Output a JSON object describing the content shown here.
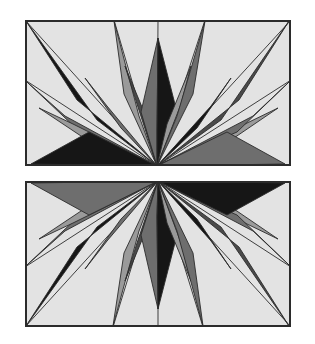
{
  "figure": {
    "background_color": "#ffffff",
    "panel_count": 2
  },
  "palette": {
    "background": "#e3e3e3",
    "border": "#2b2b2b",
    "light_gray": "#9a9a9a",
    "mid_gray": "#6e6e6e",
    "dark_gray": "#4a4a4a",
    "near_black": "#161616",
    "hairline": "#2b2b2b"
  },
  "geometry": {
    "panel_width": 266,
    "panel_height": 146,
    "panel_left": 25,
    "panel_top_y": 20,
    "panel_bottom_y": 181,
    "border_width": 2,
    "hairline_width": 0.9
  },
  "panels": [
    {
      "name": "top-panel",
      "label": "Top panel",
      "center": {
        "x": 132,
        "y": 146
      },
      "orientation": "rays-up",
      "description": "Star burst with apex at bottom edge, rays fanning upward and sideways",
      "hairlines": [
        {
          "x": 0,
          "y": 0
        },
        {
          "x": 89,
          "y": 0
        },
        {
          "x": 133,
          "y": 0
        },
        {
          "x": 180,
          "y": 0
        },
        {
          "x": 266,
          "y": 0
        },
        {
          "x": 266,
          "y": 60
        },
        {
          "x": 0,
          "y": 60
        }
      ],
      "rays": [
        {
          "id": "t-r01",
          "tip": {
            "x": 2,
            "y": 62
          },
          "l": {
            "x": 40,
            "y": 96
          },
          "r": {
            "x": 55,
            "y": 112
          },
          "shade": "mid_gray",
          "side": "left"
        },
        {
          "id": "t-r02",
          "tip": {
            "x": 14,
            "y": 88
          },
          "l": {
            "x": 48,
            "y": 104
          },
          "r": {
            "x": 62,
            "y": 120
          },
          "shade": "light_gray",
          "side": "left"
        },
        {
          "id": "t-r03",
          "tip": {
            "x": 1,
            "y": 1
          },
          "l": {
            "x": 52,
            "y": 80
          },
          "r": {
            "x": 72,
            "y": 100
          },
          "shade": "near_black",
          "side": "left"
        },
        {
          "id": "t-r04",
          "tip": {
            "x": 60,
            "y": 58
          },
          "l": {
            "x": 82,
            "y": 86
          },
          "r": {
            "x": 96,
            "y": 108
          },
          "shade": "mid_gray",
          "side": "left"
        },
        {
          "id": "t-r05",
          "tip": {
            "x": 89,
            "y": 1
          },
          "l": {
            "x": 99,
            "y": 74
          },
          "r": {
            "x": 114,
            "y": 96
          },
          "shade": "light_gray",
          "side": "left"
        },
        {
          "id": "t-r06",
          "tip": {
            "x": 100,
            "y": 46
          },
          "l": {
            "x": 112,
            "y": 84
          },
          "r": {
            "x": 124,
            "y": 104
          },
          "shade": "dark_gray",
          "side": "left"
        },
        {
          "id": "t-r07",
          "tip": {
            "x": 133,
            "y": 18
          },
          "l": {
            "x": 116,
            "y": 92
          },
          "r": {
            "x": 132,
            "y": 110
          },
          "shade": "mid_gray",
          "side": "left"
        },
        {
          "id": "t-r08",
          "tip": {
            "x": 133,
            "y": 18
          },
          "l": {
            "x": 132,
            "y": 110
          },
          "r": {
            "x": 152,
            "y": 92
          },
          "shade": "near_black",
          "side": "right"
        },
        {
          "id": "t-r09",
          "tip": {
            "x": 166,
            "y": 46
          },
          "l": {
            "x": 142,
            "y": 104
          },
          "r": {
            "x": 156,
            "y": 84
          },
          "shade": "light_gray",
          "side": "right"
        },
        {
          "id": "t-r10",
          "tip": {
            "x": 180,
            "y": 1
          },
          "l": {
            "x": 152,
            "y": 96
          },
          "r": {
            "x": 168,
            "y": 74
          },
          "shade": "mid_gray",
          "side": "right"
        },
        {
          "id": "t-r11",
          "tip": {
            "x": 206,
            "y": 58
          },
          "l": {
            "x": 172,
            "y": 108
          },
          "r": {
            "x": 186,
            "y": 86
          },
          "shade": "near_black",
          "side": "right"
        },
        {
          "id": "t-r12",
          "tip": {
            "x": 264,
            "y": 1
          },
          "l": {
            "x": 196,
            "y": 100
          },
          "r": {
            "x": 214,
            "y": 80
          },
          "shade": "dark_gray",
          "side": "right"
        },
        {
          "id": "t-r13",
          "tip": {
            "x": 253,
            "y": 88
          },
          "l": {
            "x": 206,
            "y": 120
          },
          "r": {
            "x": 220,
            "y": 104
          },
          "shade": "light_gray",
          "side": "right"
        },
        {
          "id": "t-r14",
          "tip": {
            "x": 264,
            "y": 62
          },
          "l": {
            "x": 212,
            "y": 112
          },
          "r": {
            "x": 228,
            "y": 96
          },
          "shade": "mid_gray",
          "side": "right"
        },
        {
          "id": "t-r15",
          "tip": {
            "x": 6,
            "y": 144
          },
          "l": {
            "x": 6,
            "y": 144
          },
          "r": {
            "x": 64,
            "y": 112
          },
          "shade": "near_black",
          "side": "left"
        },
        {
          "id": "t-r16",
          "tip": {
            "x": 260,
            "y": 144
          },
          "l": {
            "x": 202,
            "y": 112
          },
          "r": {
            "x": 260,
            "y": 144
          },
          "shade": "mid_gray",
          "side": "right"
        }
      ]
    },
    {
      "name": "bottom-panel",
      "label": "Bottom panel",
      "center": {
        "x": 133,
        "y": 0
      },
      "orientation": "rays-down",
      "description": "Star burst with apex at top edge, rays fanning downward and sideways",
      "hairlines": [
        {
          "x": 0,
          "y": 146
        },
        {
          "x": 88,
          "y": 146
        },
        {
          "x": 133,
          "y": 146
        },
        {
          "x": 178,
          "y": 146
        },
        {
          "x": 266,
          "y": 146
        },
        {
          "x": 266,
          "y": 86
        },
        {
          "x": 0,
          "y": 86
        }
      ],
      "rays": [
        {
          "id": "b-r01",
          "tip": {
            "x": 2,
            "y": 84
          },
          "l": {
            "x": 55,
            "y": 34
          },
          "r": {
            "x": 40,
            "y": 50
          },
          "shade": "mid_gray",
          "side": "left"
        },
        {
          "id": "b-r02",
          "tip": {
            "x": 14,
            "y": 58
          },
          "l": {
            "x": 62,
            "y": 26
          },
          "r": {
            "x": 48,
            "y": 42
          },
          "shade": "light_gray",
          "side": "left"
        },
        {
          "id": "b-r03",
          "tip": {
            "x": 1,
            "y": 145
          },
          "l": {
            "x": 72,
            "y": 46
          },
          "r": {
            "x": 52,
            "y": 66
          },
          "shade": "near_black",
          "side": "left"
        },
        {
          "id": "b-r04",
          "tip": {
            "x": 60,
            "y": 88
          },
          "l": {
            "x": 96,
            "y": 38
          },
          "r": {
            "x": 82,
            "y": 60
          },
          "shade": "mid_gray",
          "side": "left"
        },
        {
          "id": "b-r05",
          "tip": {
            "x": 88,
            "y": 145
          },
          "l": {
            "x": 114,
            "y": 50
          },
          "r": {
            "x": 99,
            "y": 72
          },
          "shade": "light_gray",
          "side": "left"
        },
        {
          "id": "b-r06",
          "tip": {
            "x": 100,
            "y": 100
          },
          "l": {
            "x": 124,
            "y": 42
          },
          "r": {
            "x": 112,
            "y": 62
          },
          "shade": "dark_gray",
          "side": "left"
        },
        {
          "id": "b-r07",
          "tip": {
            "x": 133,
            "y": 128
          },
          "l": {
            "x": 132,
            "y": 36
          },
          "r": {
            "x": 116,
            "y": 54
          },
          "shade": "mid_gray",
          "side": "left"
        },
        {
          "id": "b-r08",
          "tip": {
            "x": 133,
            "y": 128
          },
          "l": {
            "x": 152,
            "y": 54
          },
          "r": {
            "x": 132,
            "y": 36
          },
          "shade": "near_black",
          "side": "right"
        },
        {
          "id": "b-r09",
          "tip": {
            "x": 166,
            "y": 100
          },
          "l": {
            "x": 156,
            "y": 62
          },
          "r": {
            "x": 142,
            "y": 42
          },
          "shade": "light_gray",
          "side": "right"
        },
        {
          "id": "b-r10",
          "tip": {
            "x": 178,
            "y": 145
          },
          "l": {
            "x": 168,
            "y": 72
          },
          "r": {
            "x": 152,
            "y": 50
          },
          "shade": "mid_gray",
          "side": "right"
        },
        {
          "id": "b-r11",
          "tip": {
            "x": 206,
            "y": 88
          },
          "l": {
            "x": 186,
            "y": 60
          },
          "r": {
            "x": 172,
            "y": 38
          },
          "shade": "near_black",
          "side": "right"
        },
        {
          "id": "b-r12",
          "tip": {
            "x": 264,
            "y": 145
          },
          "l": {
            "x": 214,
            "y": 66
          },
          "r": {
            "x": 196,
            "y": 46
          },
          "shade": "dark_gray",
          "side": "right"
        },
        {
          "id": "b-r13",
          "tip": {
            "x": 253,
            "y": 58
          },
          "l": {
            "x": 220,
            "y": 42
          },
          "r": {
            "x": 206,
            "y": 26
          },
          "shade": "light_gray",
          "side": "right"
        },
        {
          "id": "b-r14",
          "tip": {
            "x": 264,
            "y": 84
          },
          "l": {
            "x": 228,
            "y": 50
          },
          "r": {
            "x": 212,
            "y": 34
          },
          "shade": "mid_gray",
          "side": "right"
        },
        {
          "id": "b-r15",
          "tip": {
            "x": 6,
            "y": 2
          },
          "l": {
            "x": 64,
            "y": 34
          },
          "r": {
            "x": 6,
            "y": 2
          },
          "shade": "mid_gray",
          "side": "left"
        },
        {
          "id": "b-r16",
          "tip": {
            "x": 260,
            "y": 2
          },
          "l": {
            "x": 260,
            "y": 2
          },
          "r": {
            "x": 202,
            "y": 34
          },
          "shade": "near_black",
          "side": "right"
        }
      ]
    }
  ]
}
